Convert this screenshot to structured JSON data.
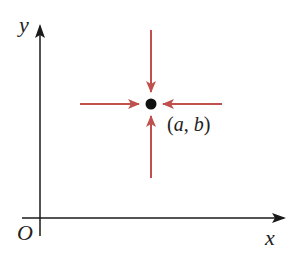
{
  "diagram": {
    "type": "coordinate-plane",
    "axes": {
      "x_label": "x",
      "y_label": "y",
      "origin_label": "O",
      "axis_color": "#1a1a1a"
    },
    "point": {
      "label_open": "(",
      "label_a": "a",
      "label_sep": ", ",
      "label_b": "b",
      "label_close": ")",
      "color": "#111111"
    },
    "arrows": {
      "color": "#c0504d",
      "directions": [
        "from-top",
        "from-bottom",
        "from-left",
        "from-right"
      ]
    }
  }
}
